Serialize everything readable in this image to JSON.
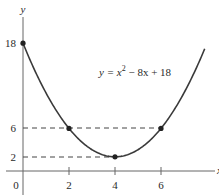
{
  "chart_data": {
    "type": "line",
    "title": "",
    "equation": "y = x² − 8x + 18",
    "equation_parts": {
      "lhs": "y = x",
      "sup": "2",
      "rhs": " − 8x + 18"
    },
    "xlabel": "x",
    "ylabel": "y",
    "xlim": [
      -0.4,
      8.6
    ],
    "ylim": [
      0,
      21
    ],
    "x_ticks": [
      0,
      2,
      4,
      6
    ],
    "x_tick_labels": [
      "0",
      "2",
      "4",
      "6"
    ],
    "y_ticks": [
      2,
      6,
      18
    ],
    "y_tick_labels": [
      "2",
      "6",
      "18"
    ],
    "grid": false,
    "legend": "none",
    "series": [
      {
        "name": "y = x^2 - 8x + 18",
        "x": [
          0,
          0.5,
          1,
          1.5,
          2,
          2.5,
          3,
          3.5,
          4,
          4.5,
          5,
          5.5,
          6,
          6.5,
          7,
          7.5,
          7.9
        ],
        "y": [
          18,
          14.25,
          11,
          8.25,
          6,
          4.25,
          3,
          2.25,
          2,
          2.25,
          3,
          4.25,
          6,
          8.25,
          11,
          14.25,
          17.21
        ]
      }
    ],
    "marked_points": [
      {
        "x": 0,
        "y": 18
      },
      {
        "x": 2,
        "y": 6
      },
      {
        "x": 4,
        "y": 2
      },
      {
        "x": 6,
        "y": 6
      }
    ],
    "dashed_guides": [
      {
        "y": 6,
        "from_x": 0,
        "to_x": 6
      },
      {
        "y": 2,
        "from_x": 0,
        "to_x": 4
      }
    ]
  },
  "colors": {
    "curve": "#3a3a3a",
    "axis": "#555555",
    "dashed": "#444444",
    "point": "#222222"
  }
}
